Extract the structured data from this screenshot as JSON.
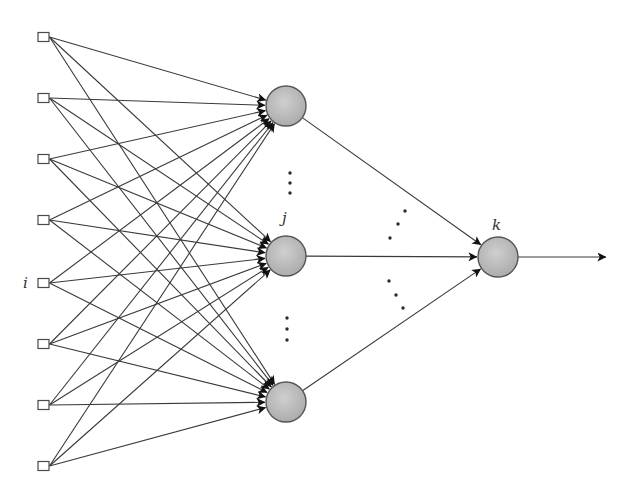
{
  "diagram": {
    "type": "feedforward-neural-network",
    "colors": {
      "background": "#ffffff",
      "edge": "#3a3a3a",
      "neuron_fill": "#bdbdbd",
      "input_stroke": "#4a4a4a"
    },
    "labels": {
      "input_label": "i",
      "hidden_label": "j",
      "output_label": "k"
    },
    "input_layer": {
      "count": 8,
      "labeled_index": 4,
      "nodes": [
        {
          "id": "input-1",
          "y": 37
        },
        {
          "id": "input-2",
          "y": 98
        },
        {
          "id": "input-3",
          "y": 159
        },
        {
          "id": "input-4",
          "y": 220
        },
        {
          "id": "input-5",
          "y": 283,
          "label": "i"
        },
        {
          "id": "input-6",
          "y": 344
        },
        {
          "id": "input-7",
          "y": 405
        },
        {
          "id": "input-8",
          "y": 466
        }
      ]
    },
    "hidden_layer": {
      "count_shown": 3,
      "ellipsis": "vertical dots between hidden nodes",
      "nodes": [
        {
          "id": "hidden-top",
          "y": 106
        },
        {
          "id": "hidden-j",
          "y": 256,
          "label": "j"
        },
        {
          "id": "hidden-bottom",
          "y": 402
        }
      ]
    },
    "output_layer": {
      "nodes": [
        {
          "id": "output-k",
          "y": 257,
          "label": "k"
        }
      ],
      "output_arrow": "to the right"
    },
    "connections": {
      "input_to_hidden": "fully connected (8 x 3)",
      "hidden_to_output": "fully connected (3 x 1)",
      "ellipsis": "diagonal dots between hidden-to-output edges"
    }
  }
}
